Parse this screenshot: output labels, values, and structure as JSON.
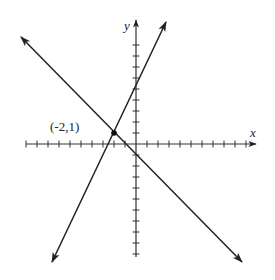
{
  "diagram": {
    "type": "coordinate-plane",
    "axes": {
      "x_label": "x",
      "y_label": "y",
      "x_ticks_range": [
        -10,
        10
      ],
      "y_ticks_range": [
        -11,
        9
      ]
    },
    "lines": [
      {
        "name": "line-1",
        "equation": "y = 2x + 5",
        "slope": 2,
        "intercept": 5
      },
      {
        "name": "line-2",
        "equation": "y = -x - 1",
        "slope": -1,
        "intercept": -1
      }
    ],
    "intersection": {
      "label": "(-2,1)",
      "x": -2,
      "y": 1
    },
    "colors": {
      "ink": "#222222",
      "background": "#ffffff"
    }
  }
}
